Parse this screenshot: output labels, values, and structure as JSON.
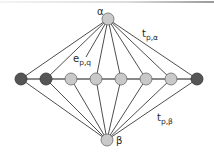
{
  "diagram": {
    "colors": {
      "edge": "#3a3a3a",
      "dark_node_fill": "#555555",
      "dark_node_stroke": "#333333",
      "light_node_fill": "#c9c9c9",
      "light_node_stroke": "#6a6a6a",
      "label": "#2a2a2a"
    },
    "apex_nodes": [
      {
        "id": "alpha",
        "label": "α",
        "x": 108,
        "y": 19,
        "r": 6,
        "label_x": 97,
        "label_y": 15
      },
      {
        "id": "beta",
        "label": "β",
        "x": 107,
        "y": 140,
        "r": 6,
        "label_x": 116,
        "label_y": 144
      }
    ],
    "chain_nodes": [
      {
        "id": "n1",
        "x": 21,
        "y": 79,
        "type": "dark"
      },
      {
        "id": "n2",
        "x": 46,
        "y": 79,
        "type": "dark"
      },
      {
        "id": "n3",
        "x": 71,
        "y": 79,
        "type": "light"
      },
      {
        "id": "n4",
        "x": 96,
        "y": 79,
        "type": "light"
      },
      {
        "id": "n5",
        "x": 121,
        "y": 79,
        "type": "light"
      },
      {
        "id": "n6",
        "x": 146,
        "y": 79,
        "type": "light"
      },
      {
        "id": "n7",
        "x": 171,
        "y": 79,
        "type": "light"
      },
      {
        "id": "n8",
        "x": 197,
        "y": 79,
        "type": "dark"
      }
    ],
    "edge_labels": [
      {
        "id": "e-pq",
        "main": "e",
        "sub": "p,q",
        "x": 73,
        "y": 62
      },
      {
        "id": "t-p-alpha",
        "main": "t",
        "sub": "p,α",
        "x": 142,
        "y": 37
      },
      {
        "id": "t-p-beta",
        "main": "t",
        "sub": "p,β",
        "x": 157,
        "y": 121
      }
    ],
    "alpha_edge_to_n3_ends_at": {
      "x": 86,
      "y": 57
    }
  }
}
